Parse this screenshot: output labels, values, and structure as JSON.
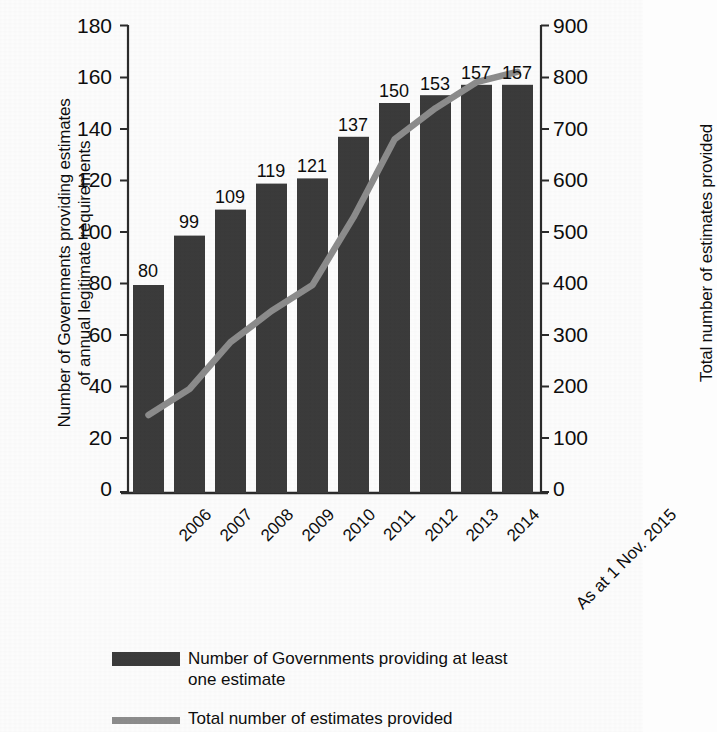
{
  "chart_data": {
    "type": "bar",
    "title": "",
    "subtitle": "",
    "categories": [
      "2006",
      "2007",
      "2008",
      "2009",
      "2010",
      "2011",
      "2012",
      "2013",
      "2014",
      "As at 1 Nov. 2015"
    ],
    "series": [
      {
        "name": "Number of Governments providing at least one estimate",
        "type": "bar",
        "axis": "left",
        "values": [
          80,
          99,
          109,
          119,
          121,
          137,
          150,
          153,
          157,
          157
        ],
        "data_labels": [
          "80",
          "99",
          "109",
          "119",
          "121",
          "137",
          "150",
          "153",
          "157",
          "157"
        ],
        "color": "#3b3b3b"
      },
      {
        "name": "Total number of estimates provided",
        "type": "line",
        "axis": "right",
        "values": [
          150,
          200,
          290,
          350,
          400,
          530,
          680,
          740,
          790,
          810
        ],
        "color": "#8c8c8c"
      }
    ],
    "xlabel": "",
    "ylabel": "Number of Governments providing estimates of annual legitimate requirements",
    "y2label": "Total number of estimates provided",
    "ylim": [
      0,
      180
    ],
    "y2lim": [
      0,
      900
    ],
    "yticks": [
      0,
      20,
      40,
      60,
      80,
      100,
      120,
      140,
      160,
      180
    ],
    "y2ticks": [
      0,
      100,
      200,
      300,
      400,
      500,
      600,
      700,
      800,
      900
    ],
    "grid": false,
    "legend_position": "bottom"
  },
  "axes": {
    "left_title_line1": "Number of Governments providing estimates",
    "left_title_line2": "of annual legitimate requirements",
    "right_title": "Total number of estimates provided",
    "left_ticks": [
      "180",
      "160",
      "140",
      "120",
      "100",
      "80",
      "60",
      "40",
      "20",
      "0"
    ],
    "right_ticks": [
      "900",
      "800",
      "700",
      "600",
      "500",
      "400",
      "300",
      "200",
      "100",
      "0"
    ]
  },
  "categories": {
    "c0": "2006",
    "c1": "2007",
    "c2": "2008",
    "c3": "2009",
    "c4": "2010",
    "c5": "2011",
    "c6": "2012",
    "c7": "2013",
    "c8": "2014",
    "c9": "As at 1 Nov. 2015"
  },
  "bar_labels": {
    "b0": "80",
    "b1": "99",
    "b2": "109",
    "b3": "119",
    "b4": "121",
    "b5": "137",
    "b6": "150",
    "b7": "153",
    "b8": "157",
    "b9": "157"
  },
  "legend": {
    "bar_entry_line1": "Number of Governments providing at least",
    "bar_entry_line2": "one estimate",
    "line_entry": "Total number of estimates provided"
  },
  "colors": {
    "bar": "#3b3b3b",
    "line": "#8c8c8c",
    "axis": "#2b2b2b",
    "text": "#0d0d0d",
    "plot_background": "#fdfdfd"
  }
}
